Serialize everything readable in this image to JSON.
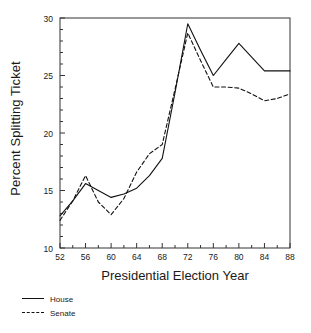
{
  "chart_data": {
    "type": "line",
    "title": "",
    "xlabel": "Presidential Election Year",
    "ylabel": "Percent Splitting Ticket",
    "xlim": [
      52,
      88
    ],
    "ylim": [
      10,
      30
    ],
    "xticks": [
      52,
      56,
      60,
      64,
      68,
      72,
      76,
      80,
      84,
      88
    ],
    "xticklabels": [
      "52",
      "56",
      "60",
      "64",
      "68",
      "72",
      "76",
      "80",
      "84",
      "88"
    ],
    "yticks": [
      10,
      15,
      20,
      25,
      30
    ],
    "yticklabels": [
      "10",
      "15",
      "20",
      "25",
      "30"
    ],
    "minor_tick_interval": 1,
    "grid": false,
    "legend_position": "below-left",
    "x": [
      52,
      54,
      56,
      58,
      60,
      62,
      64,
      66,
      68,
      70,
      72,
      74,
      76,
      78,
      80,
      82,
      84,
      86,
      88
    ],
    "series": [
      {
        "name": "House",
        "style": "solid",
        "color": "#111111",
        "values": [
          12.8,
          14.1,
          15.6,
          15.0,
          14.4,
          14.7,
          15.2,
          16.3,
          17.8,
          23.5,
          29.5,
          27.2,
          25.0,
          26.4,
          27.8,
          26.6,
          25.4,
          25.4,
          25.4
        ]
      },
      {
        "name": "Senate",
        "style": "dashed",
        "color": "#111111",
        "values": [
          12.4,
          14.1,
          16.3,
          14.0,
          12.9,
          14.3,
          16.6,
          18.2,
          19.0,
          23.8,
          28.7,
          26.3,
          24.0,
          24.0,
          23.9,
          23.4,
          22.8,
          23.0,
          23.4
        ]
      }
    ]
  },
  "legend": {
    "items": [
      {
        "label": "House",
        "style": "solid"
      },
      {
        "label": "Senate",
        "style": "dashed"
      }
    ]
  }
}
